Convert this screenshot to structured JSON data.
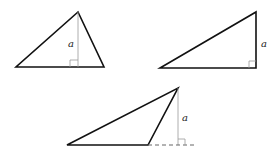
{
  "figures": [
    {
      "id": "acute-triangle",
      "altitude_label": "a",
      "stroke": "#111111",
      "altitude_color": "#999999"
    },
    {
      "id": "right-triangle",
      "altitude_label": "a",
      "stroke": "#111111",
      "altitude_color": "#999999"
    },
    {
      "id": "obtuse-triangle",
      "altitude_label": "a",
      "stroke": "#111111",
      "altitude_color": "#999999"
    }
  ]
}
